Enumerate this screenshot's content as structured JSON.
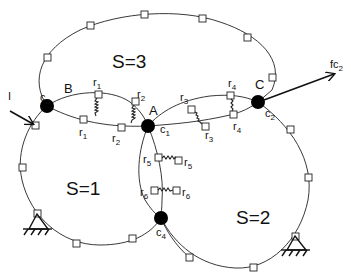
{
  "regions": {
    "s1": "S=1",
    "s2": "S=2",
    "s3": "S=3"
  },
  "nodes": {
    "A": {
      "label": "A",
      "contact": "c",
      "contact_sub": "1"
    },
    "B": {
      "label": "B",
      "contact": "c",
      "contact_sub": "3"
    },
    "C": {
      "label": "C",
      "contact": "c",
      "contact_sub": "2"
    },
    "D": {
      "label": "",
      "contact": "c",
      "contact_sub": "4"
    }
  },
  "springs": [
    {
      "name": "r",
      "sub": "1"
    },
    {
      "name": "r",
      "sub": "2"
    },
    {
      "name": "r",
      "sub": "3"
    },
    {
      "name": "r",
      "sub": "4"
    },
    {
      "name": "r",
      "sub": "5"
    },
    {
      "name": "r",
      "sub": "6"
    }
  ],
  "forces": {
    "right": {
      "label": "fc",
      "sub": "2"
    },
    "left": {
      "label": "I"
    }
  },
  "colors": {
    "line": "#222222",
    "node": "#000000",
    "background": "#ffffff"
  }
}
